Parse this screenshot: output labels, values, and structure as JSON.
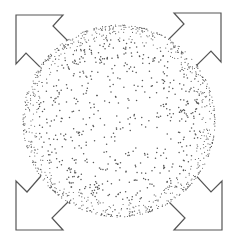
{
  "figure": {
    "icon_name": "expand-sphere-icon",
    "colors": {
      "background": "#ffffff",
      "dots": "#555555",
      "arrow_stroke": "#555555",
      "arrow_fill": "#ffffff"
    },
    "arrows": [
      {
        "name": "arrow-top-left",
        "direction": "up-left"
      },
      {
        "name": "arrow-top-right",
        "direction": "up-right"
      },
      {
        "name": "arrow-bottom-left",
        "direction": "down-left"
      },
      {
        "name": "arrow-bottom-right",
        "direction": "down-right"
      }
    ],
    "stipple": {
      "dot_count": 1400,
      "seed": 7
    }
  }
}
